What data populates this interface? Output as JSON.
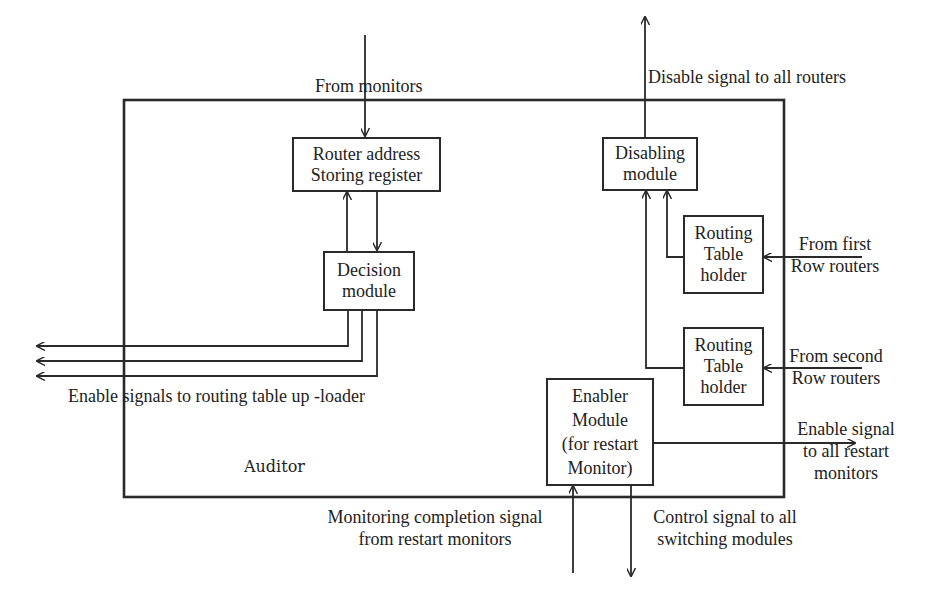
{
  "diagram": {
    "container": {
      "label": "Auditor"
    },
    "boxes": {
      "router": {
        "line1": "Router address",
        "line2": "Storing register"
      },
      "decision": {
        "line1": "Decision",
        "line2": "module"
      },
      "disabling": {
        "line1": "Disabling",
        "line2": "module"
      },
      "routing1": {
        "line1": "Routing",
        "line2": "Table",
        "line3": "holder"
      },
      "routing2": {
        "line1": "Routing",
        "line2": "Table",
        "line3": "holder"
      },
      "enabler": {
        "line1": "Enabler",
        "line2": "Module",
        "line3": "(for restart",
        "line4": "Monitor)"
      }
    },
    "signals": {
      "from_monitors": "From monitors",
      "disable_all": "Disable signal to all routers",
      "from_first_1": "From first",
      "from_first_2": "Row routers",
      "from_second_1": "From second",
      "from_second_2": "Row routers",
      "enable_uploader": "Enable signals to routing table up -loader",
      "enable_restart_1": "Enable signal",
      "enable_restart_2": "to all restart",
      "enable_restart_3": "monitors",
      "monitoring_1": "Monitoring completion signal",
      "monitoring_2": "from restart monitors",
      "control_1": "Control signal to all",
      "control_2": "switching modules"
    }
  }
}
